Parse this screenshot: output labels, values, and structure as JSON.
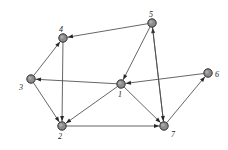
{
  "figure": {
    "type": "directed-graph-diagram",
    "background_color": "#ffffff",
    "node_fill_color": "#8c8c8c",
    "node_stroke_color": "#2b2b2b",
    "edge_color": "#4a4a4a",
    "label_color": "#1a1a1a",
    "node_radius": 4.2,
    "width": 228,
    "height": 150
  },
  "nodes": [
    {
      "id": "1",
      "label": "1",
      "x": 121,
      "y": 84,
      "label_x": 118,
      "label_y": 91
    },
    {
      "id": "2",
      "label": "2",
      "x": 62,
      "y": 126,
      "label_x": 58,
      "label_y": 133
    },
    {
      "id": "3",
      "label": "3",
      "x": 31,
      "y": 79,
      "label_x": 19,
      "label_y": 84
    },
    {
      "id": "4",
      "label": "4",
      "x": 63,
      "y": 38,
      "label_x": 59,
      "label_y": 26
    },
    {
      "id": "5",
      "label": "5",
      "x": 152,
      "y": 23,
      "label_x": 149,
      "label_y": 11
    },
    {
      "id": "6",
      "label": "6",
      "x": 208,
      "y": 73,
      "label_x": 215,
      "label_y": 71
    },
    {
      "id": "7",
      "label": "7",
      "x": 164,
      "y": 126,
      "label_x": 171,
      "label_y": 131
    }
  ],
  "edges": [
    {
      "from": "3",
      "to": "4",
      "directed": true
    },
    {
      "from": "5",
      "to": "4",
      "directed": true
    },
    {
      "from": "4",
      "to": "2",
      "directed": true
    },
    {
      "from": "3",
      "to": "2",
      "directed": true
    },
    {
      "from": "1",
      "to": "3",
      "directed": true
    },
    {
      "from": "1",
      "to": "2",
      "directed": true
    },
    {
      "from": "5",
      "to": "1",
      "directed": true
    },
    {
      "from": "6",
      "to": "1",
      "directed": true
    },
    {
      "from": "7",
      "to": "5",
      "directed": true
    },
    {
      "from": "5",
      "to": "7",
      "directed": true
    },
    {
      "from": "2",
      "to": "7",
      "directed": true
    },
    {
      "from": "1",
      "to": "7",
      "directed": true
    },
    {
      "from": "7",
      "to": "6",
      "directed": true
    }
  ]
}
